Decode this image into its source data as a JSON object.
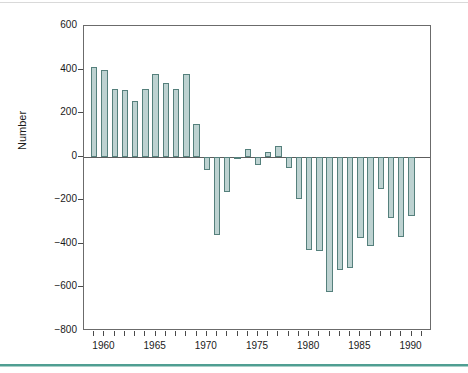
{
  "figure": {
    "ylabel": "Number",
    "xlabel": "",
    "title": "",
    "bar_fill_color": "#bdd2d1",
    "bar_border_color": "#55807c",
    "axis_color": "#4a4a4a",
    "accent_rule_color": "#4f9e92"
  },
  "chart_data": {
    "type": "bar",
    "title": "",
    "xlabel": "",
    "ylabel": "Number",
    "ylim": [
      -800,
      600
    ],
    "xlim": [
      1958,
      1992
    ],
    "grid": false,
    "legend": null,
    "ytick_labels": [
      "600",
      "400",
      "200",
      "0",
      "−200",
      "−400",
      "−600",
      "−800"
    ],
    "ytick_values": [
      600,
      400,
      200,
      0,
      -200,
      -400,
      -600,
      -800
    ],
    "xtick_labels": [
      "1960",
      "1965",
      "1970",
      "1975",
      "1980",
      "1985",
      "1990"
    ],
    "xtick_values": [
      1960,
      1965,
      1970,
      1975,
      1980,
      1985,
      1990
    ],
    "minor_xticks": [
      1959,
      1960,
      1961,
      1962,
      1963,
      1964,
      1965,
      1966,
      1967,
      1968,
      1969,
      1970,
      1971,
      1972,
      1973,
      1974,
      1975,
      1976,
      1977,
      1978,
      1979,
      1980,
      1981,
      1982,
      1983,
      1984,
      1985,
      1986,
      1987,
      1988,
      1989,
      1990,
      1991
    ],
    "categories": [
      1959,
      1960,
      1961,
      1962,
      1963,
      1964,
      1965,
      1966,
      1967,
      1968,
      1969,
      1970,
      1971,
      1972,
      1973,
      1974,
      1975,
      1976,
      1977,
      1978,
      1979,
      1980,
      1981,
      1982,
      1983,
      1984,
      1985,
      1986,
      1987,
      1988,
      1989,
      1990,
      1991
    ],
    "values": [
      410,
      400,
      310,
      305,
      255,
      310,
      380,
      340,
      312,
      378,
      150,
      -60,
      -360,
      -160,
      -5,
      35,
      -40,
      20,
      48,
      -50,
      -195,
      -430,
      -435,
      -620,
      -520,
      -512,
      -375,
      -410,
      -150,
      -280,
      -370,
      -270,
      null
    ]
  }
}
